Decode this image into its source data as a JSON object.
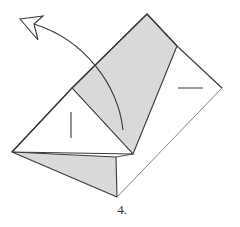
{
  "diagram": {
    "type": "origami-fold-step",
    "step_label": "4.",
    "colors": {
      "paper_white": "#ffffff",
      "paper_shaded": "#d9d9d9",
      "line": "#3a3a3a",
      "background": "#ffffff"
    },
    "elements": [
      {
        "name": "outer-square",
        "description": "Diamond-shaped paper outline"
      },
      {
        "name": "shaded-flap",
        "description": "Gray colored side of paper showing"
      },
      {
        "name": "left-triangle",
        "description": "White triangular flap on left"
      },
      {
        "name": "bottom-flap",
        "description": "Gray bottom flap"
      },
      {
        "name": "fold-arrow",
        "description": "Curved arrow indicating fold up and to the left"
      },
      {
        "name": "crease-marks",
        "description": "Short crease tick marks"
      }
    ]
  }
}
